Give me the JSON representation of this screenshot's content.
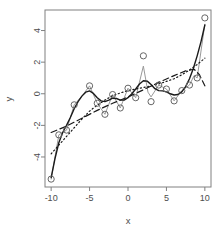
{
  "chart_data": {
    "type": "scatter",
    "title": "",
    "subtitle": "",
    "xlabel": "x",
    "ylabel": "y",
    "xlim": [
      -10.8,
      10.8
    ],
    "ylim": [
      -5.9,
      5.3
    ],
    "grid": false,
    "legend": "none",
    "x_ticks": [
      -10,
      -5,
      0,
      5,
      10
    ],
    "x_tick_labels": [
      "-10",
      "-5",
      "0",
      "5",
      "10"
    ],
    "y_ticks": [
      -4,
      -2,
      0,
      2,
      4
    ],
    "y_tick_labels": [
      "-4",
      "-2",
      "0",
      "2",
      "4"
    ],
    "point_marker": "open-circle",
    "point_color": "#666666",
    "points": [
      {
        "x": -10.0,
        "y": -5.4
      },
      {
        "x": -9.0,
        "y": -2.6
      },
      {
        "x": -8.0,
        "y": -2.3
      },
      {
        "x": -7.0,
        "y": -0.7
      },
      {
        "x": -5.0,
        "y": 0.5
      },
      {
        "x": -4.0,
        "y": -0.6
      },
      {
        "x": -3.0,
        "y": -1.3
      },
      {
        "x": -2.0,
        "y": -0.05
      },
      {
        "x": -1.0,
        "y": -0.9
      },
      {
        "x": 0.0,
        "y": 0.35
      },
      {
        "x": 1.0,
        "y": -0.25
      },
      {
        "x": 2.0,
        "y": 2.4
      },
      {
        "x": 3.0,
        "y": -0.5
      },
      {
        "x": 4.0,
        "y": 0.55
      },
      {
        "x": 5.0,
        "y": 0.3
      },
      {
        "x": 6.0,
        "y": -0.45
      },
      {
        "x": 7.0,
        "y": 0.2
      },
      {
        "x": 8.0,
        "y": 0.55
      },
      {
        "x": 9.0,
        "y": 1.0
      },
      {
        "x": 10.0,
        "y": 4.8
      }
    ],
    "series": [
      {
        "name": "interpolating-grey-line",
        "style": "solid",
        "color": "#999999",
        "width": 1,
        "values": [
          {
            "x": -10.0,
            "y": -5.4
          },
          {
            "x": -9.0,
            "y": -2.6
          },
          {
            "x": -8.0,
            "y": -2.3
          },
          {
            "x": -7.0,
            "y": -0.7
          },
          {
            "x": -6.0,
            "y": -0.15
          },
          {
            "x": -5.0,
            "y": 0.5
          },
          {
            "x": -4.0,
            "y": -0.6
          },
          {
            "x": -3.0,
            "y": -1.3
          },
          {
            "x": -2.0,
            "y": -0.05
          },
          {
            "x": -1.0,
            "y": -0.9
          },
          {
            "x": 0.0,
            "y": 0.35
          },
          {
            "x": 1.0,
            "y": -0.25
          },
          {
            "x": 2.0,
            "y": 1.75
          },
          {
            "x": 2.6,
            "y": 0.1
          },
          {
            "x": 3.0,
            "y": -0.2
          },
          {
            "x": 4.0,
            "y": 0.55
          },
          {
            "x": 5.0,
            "y": 0.3
          },
          {
            "x": 6.0,
            "y": -0.45
          },
          {
            "x": 7.0,
            "y": 0.2
          },
          {
            "x": 8.0,
            "y": 0.55
          },
          {
            "x": 8.6,
            "y": 1.15
          },
          {
            "x": 9.0,
            "y": 1.0
          },
          {
            "x": 10.0,
            "y": 4.4
          }
        ]
      },
      {
        "name": "smooth-spline-black-solid",
        "style": "solid",
        "color": "#1a1a1a",
        "width": 1.4,
        "values": [
          {
            "x": -10.0,
            "y": -5.3
          },
          {
            "x": -9.5,
            "y": -4.1
          },
          {
            "x": -9.0,
            "y": -3.1
          },
          {
            "x": -8.5,
            "y": -2.45
          },
          {
            "x": -8.0,
            "y": -2.0
          },
          {
            "x": -7.5,
            "y": -1.5
          },
          {
            "x": -7.0,
            "y": -0.95
          },
          {
            "x": -6.5,
            "y": -0.5
          },
          {
            "x": -6.0,
            "y": -0.15
          },
          {
            "x": -5.5,
            "y": 0.1
          },
          {
            "x": -5.0,
            "y": 0.18
          },
          {
            "x": -4.5,
            "y": 0.02
          },
          {
            "x": -4.0,
            "y": -0.25
          },
          {
            "x": -3.5,
            "y": -0.45
          },
          {
            "x": -3.0,
            "y": -0.5
          },
          {
            "x": -2.5,
            "y": -0.4
          },
          {
            "x": -2.0,
            "y": -0.28
          },
          {
            "x": -1.5,
            "y": -0.3
          },
          {
            "x": -1.0,
            "y": -0.4
          },
          {
            "x": -0.5,
            "y": -0.4
          },
          {
            "x": 0.0,
            "y": -0.25
          },
          {
            "x": 0.5,
            "y": 0.0
          },
          {
            "x": 1.0,
            "y": 0.3
          },
          {
            "x": 1.5,
            "y": 0.62
          },
          {
            "x": 2.0,
            "y": 0.82
          },
          {
            "x": 2.5,
            "y": 0.8
          },
          {
            "x": 3.0,
            "y": 0.58
          },
          {
            "x": 3.5,
            "y": 0.32
          },
          {
            "x": 4.0,
            "y": 0.2
          },
          {
            "x": 4.5,
            "y": 0.18
          },
          {
            "x": 5.0,
            "y": 0.12
          },
          {
            "x": 5.5,
            "y": 0.0
          },
          {
            "x": 6.0,
            "y": -0.08
          },
          {
            "x": 6.5,
            "y": -0.05
          },
          {
            "x": 7.0,
            "y": 0.12
          },
          {
            "x": 7.5,
            "y": 0.45
          },
          {
            "x": 8.0,
            "y": 0.95
          },
          {
            "x": 8.5,
            "y": 1.6
          },
          {
            "x": 9.0,
            "y": 2.4
          },
          {
            "x": 9.5,
            "y": 3.3
          },
          {
            "x": 10.0,
            "y": 4.35
          }
        ]
      },
      {
        "name": "linear-fit-black-dashed",
        "style": "dashed",
        "color": "#1a1a1a",
        "width": 1.2,
        "values": [
          {
            "x": -10.0,
            "y": -2.45
          },
          {
            "x": -8.0,
            "y": -2.05
          },
          {
            "x": -6.0,
            "y": -1.55
          },
          {
            "x": -4.0,
            "y": -1.05
          },
          {
            "x": -2.0,
            "y": -0.6
          },
          {
            "x": 0.0,
            "y": -0.2
          },
          {
            "x": 2.0,
            "y": 0.25
          },
          {
            "x": 4.0,
            "y": 0.72
          },
          {
            "x": 6.0,
            "y": 1.15
          },
          {
            "x": 7.5,
            "y": 1.45
          },
          {
            "x": 8.6,
            "y": 1.55
          },
          {
            "x": 9.3,
            "y": 1.2
          },
          {
            "x": 10.0,
            "y": 0.5
          }
        ]
      },
      {
        "name": "polynomial-fit-black-dotted",
        "style": "dotted",
        "color": "#1a1a1a",
        "width": 1.2,
        "values": [
          {
            "x": -10.0,
            "y": -3.8
          },
          {
            "x": -9.0,
            "y": -3.25
          },
          {
            "x": -8.0,
            "y": -2.7
          },
          {
            "x": -7.0,
            "y": -2.15
          },
          {
            "x": -6.0,
            "y": -1.6
          },
          {
            "x": -5.0,
            "y": -1.1
          },
          {
            "x": -4.0,
            "y": -0.72
          },
          {
            "x": -3.0,
            "y": -0.4
          },
          {
            "x": -2.0,
            "y": -0.12
          },
          {
            "x": -1.0,
            "y": 0.05
          },
          {
            "x": 0.0,
            "y": 0.2
          },
          {
            "x": 1.0,
            "y": 0.3
          },
          {
            "x": 2.0,
            "y": 0.4
          },
          {
            "x": 3.0,
            "y": 0.5
          },
          {
            "x": 4.0,
            "y": 0.62
          },
          {
            "x": 5.0,
            "y": 0.78
          },
          {
            "x": 6.0,
            "y": 0.95
          },
          {
            "x": 7.0,
            "y": 1.2
          },
          {
            "x": 8.0,
            "y": 1.5
          },
          {
            "x": 9.0,
            "y": 1.85
          },
          {
            "x": 10.0,
            "y": 2.25
          }
        ]
      }
    ]
  },
  "axes": {
    "x_title": "x",
    "y_title": "y",
    "frame_color": "#808080",
    "tick_color": "#808080",
    "label_color": "#4d4d4d"
  }
}
